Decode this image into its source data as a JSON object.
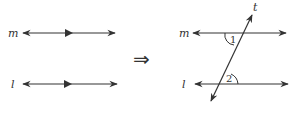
{
  "diagram": {
    "left_panel": {
      "line_m_label": "m",
      "line_l_label": "l"
    },
    "implies_symbol": "⇒",
    "right_panel": {
      "line_m_label": "m",
      "line_l_label": "l",
      "transversal_label": "t",
      "angle_1_label": "1",
      "angle_2_label": "2"
    },
    "colors": {
      "stroke": "#333333",
      "background": "#ffffff"
    }
  }
}
